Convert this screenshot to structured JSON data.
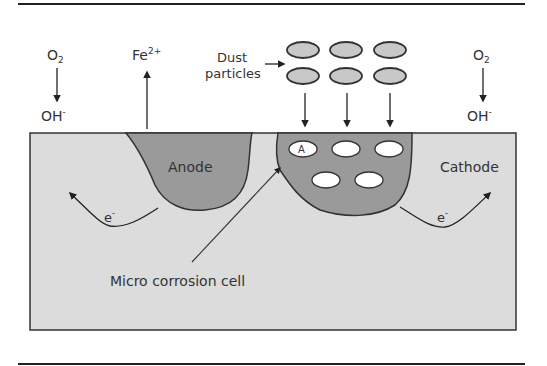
{
  "diagram": {
    "labels": {
      "o2_left": "O",
      "o2_left_sub": "2",
      "oh_left": "OH",
      "oh_left_sup": "-",
      "fe": "Fe",
      "fe_sup": "2+",
      "dust_line1": "Dust",
      "dust_line2": "particles",
      "o2_right": "O",
      "o2_right_sub": "2",
      "oh_right": "OH",
      "oh_right_sup": "-",
      "anode": "Anode",
      "cathode": "Cathode",
      "particle_a": "A",
      "electron_left": "e",
      "electron_left_sup": "-",
      "electron_right": "e",
      "electron_right_sup": "-",
      "micro_cell": "Micro corrosion cell"
    },
    "colors": {
      "metal": "#dcdcdc",
      "pit": "#9a9a9a",
      "outline": "#333333",
      "particle_fill": "#c8c8c8",
      "embedded_particle": "#ffffff"
    }
  }
}
